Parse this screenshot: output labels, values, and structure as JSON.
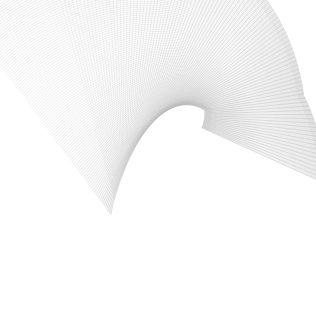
{
  "figure": {
    "kind": "wireframe-mesh-plot",
    "width": 316,
    "height": 331,
    "background_color": "#ffffff",
    "line_color": "#6e6e6e",
    "line_color_light": "#b9b9b9",
    "line_color_dark": "#4a4a4a",
    "line_width": 0.3,
    "line_opacity": 0.55,
    "has_axes": false,
    "has_labels": false,
    "has_legend": false,
    "has_title_text": false
  },
  "chart_data": {
    "type": "line",
    "title": "",
    "subtitle": "",
    "xlabel": "",
    "ylabel": "",
    "grid": false,
    "legend_position": "none",
    "surface_kind": "cusp-fold-sheet",
    "u_range": [
      0,
      6.2832
    ],
    "v_range": [
      0,
      1
    ],
    "u_lines": 120,
    "v_lines": 120,
    "samples_per_line": 110,
    "projection": {
      "type": "parametric-2d",
      "center_x": 158,
      "center_y": 168,
      "scale_x": 148,
      "scale_y": 152
    },
    "shape_params": {
      "a": 1.0,
      "b": 0.62,
      "c": 0.38,
      "twist": 2.15,
      "fold": 1.35,
      "phase": 0.42,
      "skew": 0.28,
      "sweep": 2.45,
      "taper": 0.55
    },
    "silhouette_bbox": {
      "x_min": 2,
      "y_min": 18,
      "x_max": 302,
      "y_max": 322
    },
    "density_regions": [
      {
        "name": "upper-left-sparse-fan",
        "x": 5,
        "y": 25,
        "w": 150,
        "h": 120,
        "density": "sparse"
      },
      {
        "name": "upper-arc-band",
        "x": 40,
        "y": 22,
        "w": 250,
        "h": 110,
        "density": "medium"
      },
      {
        "name": "central-dark-sheet",
        "x": 70,
        "y": 85,
        "w": 170,
        "h": 140,
        "density": "dense"
      },
      {
        "name": "right-fold-cusp",
        "x": 230,
        "y": 130,
        "w": 72,
        "h": 70,
        "density": "dense"
      },
      {
        "name": "lower-tube-fold",
        "x": 75,
        "y": 200,
        "w": 150,
        "h": 122,
        "density": "dense"
      },
      {
        "name": "lower-right-tail",
        "x": 170,
        "y": 210,
        "w": 90,
        "h": 95,
        "density": "medium"
      }
    ]
  }
}
